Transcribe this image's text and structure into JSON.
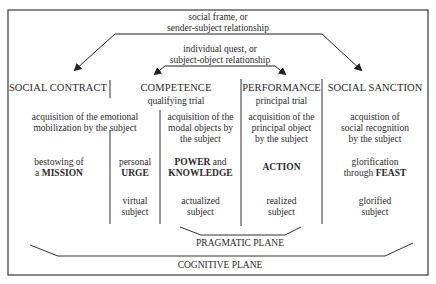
{
  "frame": {
    "stroke": "#3a3a3a"
  },
  "top_relations": {
    "social_frame": [
      "social frame, or",
      "sender-subject relationship"
    ],
    "individual_quest": [
      "individual quest, or",
      "subject-object relationship"
    ]
  },
  "columns": [
    {
      "heading": "SOCIAL CONTRACT",
      "subheading": "",
      "acquisition": [
        "acquisition of the emotional",
        "mobilization by the subject"
      ],
      "content_pre": "bestowing of",
      "content_pre2": "a",
      "content_bold": "MISSION"
    },
    {
      "heading": "",
      "subheading": "",
      "content_pre": "personal",
      "content_bold": "URGE",
      "subject": [
        "virtual",
        "subject"
      ]
    },
    {
      "heading": "COMPETENCE",
      "subheading": "qualifying trial",
      "acquisition": [
        "acquisition of the",
        "modal objects by",
        "the subject"
      ],
      "content_bold": "POWER",
      "content_mid": " and",
      "content_bold2": "KNOWLEDGE",
      "subject": [
        "actualized",
        "subject"
      ]
    },
    {
      "heading": "PERFORMANCE",
      "subheading": "principal trial",
      "acquisition": [
        "acquisition of the",
        "principal object",
        "by the subject"
      ],
      "content_bold": "ACTION",
      "subject": [
        "realized",
        "subject"
      ]
    },
    {
      "heading": "SOCIAL SANCTION",
      "subheading": "",
      "acquisition": [
        "acquistion of",
        "social recognition",
        "by the subject"
      ],
      "content_pre": "glorification",
      "content_pre2": "through",
      "content_bold": "FEAST",
      "subject": [
        "glorified",
        "subject"
      ]
    }
  ],
  "planes": {
    "pragmatic": "PRAGMATIC PLANE",
    "cognitive": "COGNITIVE PLANE"
  }
}
